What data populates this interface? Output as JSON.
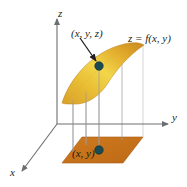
{
  "figure": {
    "background_color": "#ffffff"
  },
  "axes": {
    "z_label": "z",
    "y_label": "y",
    "x_label": "x",
    "axis_color": "#6d6e71",
    "origin": {
      "x": 57,
      "y": 124
    }
  },
  "labels": {
    "point_on_surface": "(x, y, z)",
    "surface_equation": "z = f(x, y)",
    "point_in_plane": "(x, y)"
  },
  "surface": {
    "name": "z = f(x, y)",
    "fill_light": "#f3d23e",
    "fill_mid": "#e0a832",
    "fill_dark": "#c98a27",
    "edge_color": "#b9801f"
  },
  "base_plane": {
    "fill": "#c8721c",
    "edge_color": "#a85c14"
  },
  "points": {
    "surface_point": {
      "x": 99,
      "y": 66,
      "color": "#1b4a52",
      "radius": 4
    },
    "plane_point": {
      "x": 99,
      "y": 150,
      "color": "#1b4a52",
      "radius": 4
    }
  },
  "connectors": {
    "color": "#9a9b9d",
    "count": 4
  },
  "arrow": {
    "name": "callout-arrow",
    "color": "#231f20",
    "from": {
      "x": 80,
      "y": 38
    },
    "to": {
      "x": 97,
      "y": 62
    }
  }
}
